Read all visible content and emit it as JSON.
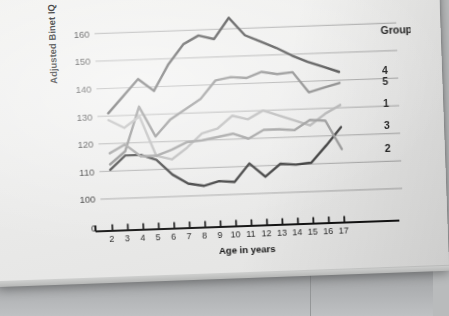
{
  "chart_data": {
    "type": "line",
    "title": "",
    "xlabel": "Age in years",
    "ylabel": "Adjusted Binet IQ",
    "legend_title": "Group",
    "legend_position": "right",
    "grid": true,
    "x": [
      2,
      3,
      4,
      5,
      6,
      7,
      8,
      9,
      10,
      11,
      12,
      13,
      14,
      15,
      16,
      17
    ],
    "xtick_labels": [
      "2",
      "3",
      "4",
      "5",
      "6",
      "7",
      "8",
      "9",
      "10",
      "11",
      "12",
      "13",
      "14",
      "15",
      "16",
      "17"
    ],
    "ytick_labels": [
      "0",
      "100",
      "110",
      "120",
      "130",
      "140",
      "150",
      "160"
    ],
    "yticks": [
      0,
      100,
      110,
      120,
      130,
      140,
      150,
      160
    ],
    "ylim": [
      96,
      167
    ],
    "xlim": [
      1.55,
      17.45
    ],
    "series": [
      {
        "name": "4",
        "label": "4",
        "color": "#3c3c3c",
        "values": [
          131.0,
          137.0,
          143.0,
          138.5,
          148.0,
          155.0,
          158.0,
          156.5,
          164.0,
          157.5,
          155.0,
          152.5,
          149.5,
          147.0,
          145.0,
          143.0
        ]
      },
      {
        "name": "5",
        "label": "5",
        "color": "#7d7d7d",
        "values": [
          112.5,
          117.0,
          133.0,
          122.0,
          128.0,
          131.5,
          135.0,
          141.5,
          142.5,
          142.0,
          144.0,
          143.0,
          143.5,
          136.0,
          137.5,
          139.0
        ]
      },
      {
        "name": "1",
        "label": "1",
        "color": "#b0b0b0",
        "values": [
          128.5,
          125.5,
          129.5,
          115.0,
          113.5,
          117.5,
          122.5,
          124.0,
          128.5,
          127.0,
          130.0,
          128.0,
          126.0,
          124.0,
          128.0,
          131.0
        ]
      },
      {
        "name": "3",
        "label": "3",
        "color": "#2a2a2a",
        "values": [
          110.5,
          115.5,
          115.5,
          113.5,
          108.0,
          104.5,
          103.5,
          105.0,
          104.5,
          111.0,
          106.0,
          110.5,
          110.0,
          110.5,
          116.5,
          123.0
        ]
      },
      {
        "name": "2",
        "label": "2",
        "color": "#919191",
        "values": [
          116.5,
          119.5,
          115.0,
          115.0,
          117.0,
          119.5,
          120.0,
          121.0,
          122.0,
          120.0,
          123.0,
          123.0,
          122.5,
          126.0,
          125.5,
          115.0
        ]
      }
    ],
    "legend_entries": [
      {
        "label": "4",
        "color": "#3c3c3c",
        "y_value": 143.0
      },
      {
        "label": "5",
        "color": "#7d7d7d",
        "y_value": 139.0
      },
      {
        "label": "1",
        "color": "#b0b0b0",
        "y_value": 131.0
      },
      {
        "label": "3",
        "color": "#2a2a2a",
        "y_value": 123.0
      },
      {
        "label": "2",
        "color": "#919191",
        "y_value": 115.0
      }
    ]
  }
}
